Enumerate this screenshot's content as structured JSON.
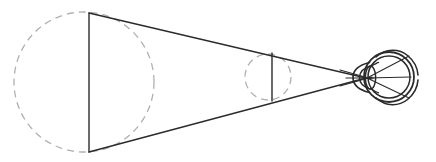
{
  "figure": {
    "type": "line-diagram",
    "canvas": {
      "width": 436,
      "height": 162,
      "background": "#ffffff"
    },
    "colors": {
      "solid_stroke": "#2b2b2b",
      "dashed_stroke": "#b0b0b0",
      "eye_stroke": "#2b2b2b",
      "background": "#ffffff"
    },
    "stroke_widths": {
      "cone_line": 1.4,
      "object_bar": 1.4,
      "dashed_circle": 1.3,
      "eye_outline": 1.8,
      "eye_detail": 1.5,
      "ray": 1.1
    },
    "dash_pattern": "7,5"
  },
  "elements": {
    "large_object_circle": {
      "name": "large-dashed-circle",
      "cx": 84,
      "cy": 82,
      "r": 70,
      "style": "dashed",
      "color": "#b0b0b0"
    },
    "large_object_bar": {
      "name": "large-object-vertical-bar",
      "x": 89,
      "y1": 13,
      "y2": 152,
      "style": "solid",
      "color": "#2b2b2b"
    },
    "small_object_circle": {
      "name": "small-dashed-circle",
      "cx": 268,
      "cy": 77,
      "r": 23,
      "style": "dashed",
      "color": "#b0b0b0"
    },
    "small_object_bar": {
      "name": "small-object-vertical-bar",
      "x": 272,
      "y1": 53,
      "y2": 101,
      "style": "solid",
      "color": "#2b2b2b"
    },
    "cone_upper_edge": {
      "name": "cone-upper-edge",
      "x1": 89,
      "y1": 13,
      "x2": 366,
      "y2": 78
    },
    "cone_lower_edge": {
      "name": "cone-lower-edge",
      "x1": 89,
      "y1": 152,
      "x2": 366,
      "y2": 78
    },
    "eye": {
      "name": "eye-assembly",
      "center_x": 389,
      "center_y": 77,
      "sclera_outer_r": 25,
      "retina_inner_r": 21,
      "nodal_point": {
        "x": 366,
        "y": 78
      },
      "parts": [
        {
          "name": "sclera-outer-circle",
          "label": "sclera"
        },
        {
          "name": "retina-inner-circle",
          "label": "retina"
        },
        {
          "name": "cornea-bulge",
          "label": "cornea"
        },
        {
          "name": "lens-ellipse",
          "label": "lens"
        },
        {
          "name": "anterior-chamber-arc",
          "label": "anterior chamber"
        },
        {
          "name": "optic-nerve-arc-top",
          "label": "outer arc top"
        },
        {
          "name": "optic-nerve-arc-bottom",
          "label": "outer arc bottom"
        }
      ]
    },
    "internal_rays": {
      "name": "retinal-image-rays",
      "origin": {
        "x": 366,
        "y": 78
      },
      "endpoints": [
        {
          "x": 409,
          "y": 56
        },
        {
          "x": 411,
          "y": 77
        },
        {
          "x": 409,
          "y": 98
        }
      ]
    },
    "axis_rays": {
      "name": "optical-axis-rays",
      "lines": [
        {
          "x1": 340,
          "y1": 70,
          "x2": 372,
          "y2": 79
        },
        {
          "x1": 340,
          "y1": 86,
          "x2": 372,
          "y2": 77
        },
        {
          "x1": 346,
          "y1": 78,
          "x2": 374,
          "y2": 78
        }
      ]
    }
  },
  "labels": {
    "visible_text": []
  }
}
